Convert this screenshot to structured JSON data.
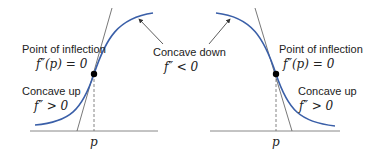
{
  "diagram": {
    "colors": {
      "curve": "#3a5fa8",
      "axis": "#777777",
      "tangent": "#555555",
      "point": "#000000"
    },
    "left": {
      "inflection_label": "Point of inflection",
      "inflection_math": "f″(p) = 0",
      "concave_up_label": "Concave up",
      "concave_up_math": "f″ > 0",
      "axis_label": "p"
    },
    "center": {
      "concave_down_label": "Concave down",
      "concave_down_math": "f″ < 0"
    },
    "right": {
      "inflection_label": "Point of inflection",
      "inflection_math": "f″(p) = 0",
      "concave_up_label": "Concave up",
      "concave_up_math": "f″ > 0",
      "axis_label": "p"
    }
  }
}
